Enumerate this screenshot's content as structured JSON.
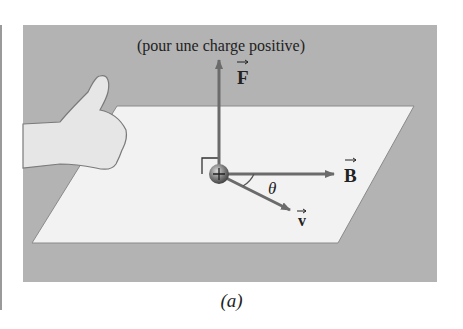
{
  "figure": {
    "title": "(pour une charge positive)",
    "caption": "(a)",
    "vectors": {
      "force": "F",
      "field": "B",
      "velocity": "v"
    },
    "angle_label": "θ",
    "charge_sign": "+",
    "colors": {
      "background": "#b3b3b3",
      "plane": "#f2f2f2",
      "arrow": "#6b6b6b",
      "text": "#222222"
    }
  }
}
